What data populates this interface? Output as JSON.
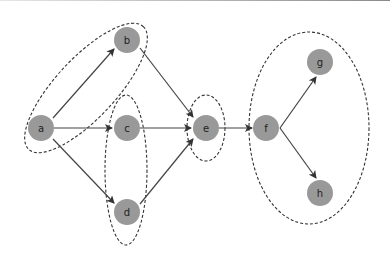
{
  "diagram": {
    "type": "directed-graph",
    "colors": {
      "node_fill": "#999999",
      "edge": "#444444",
      "group_outline": "#333333",
      "background": "#ffffff"
    },
    "nodes": [
      {
        "id": "a",
        "label": "a",
        "x": 41,
        "y": 128
      },
      {
        "id": "b",
        "label": "b",
        "x": 127,
        "y": 40
      },
      {
        "id": "c",
        "label": "c",
        "x": 127,
        "y": 128
      },
      {
        "id": "d",
        "label": "d",
        "x": 127,
        "y": 212
      },
      {
        "id": "e",
        "label": "e",
        "x": 206,
        "y": 128
      },
      {
        "id": "f",
        "label": "f",
        "x": 266,
        "y": 128
      },
      {
        "id": "g",
        "label": "g",
        "x": 320,
        "y": 62
      },
      {
        "id": "h",
        "label": "h",
        "x": 320,
        "y": 193
      }
    ],
    "edges": [
      {
        "from": "a",
        "to": "b"
      },
      {
        "from": "a",
        "to": "c"
      },
      {
        "from": "a",
        "to": "d"
      },
      {
        "from": "b",
        "to": "e"
      },
      {
        "from": "c",
        "to": "e"
      },
      {
        "from": "d",
        "to": "e"
      },
      {
        "from": "e",
        "to": "f"
      },
      {
        "from": "f",
        "to": "g"
      },
      {
        "from": "f",
        "to": "h"
      }
    ],
    "groups": [
      {
        "id": "group-ab",
        "members": [
          "a",
          "b"
        ]
      },
      {
        "id": "group-cd",
        "members": [
          "c",
          "d"
        ]
      },
      {
        "id": "group-e",
        "members": [
          "e"
        ]
      },
      {
        "id": "group-fgh",
        "members": [
          "f",
          "g",
          "h"
        ]
      }
    ]
  }
}
